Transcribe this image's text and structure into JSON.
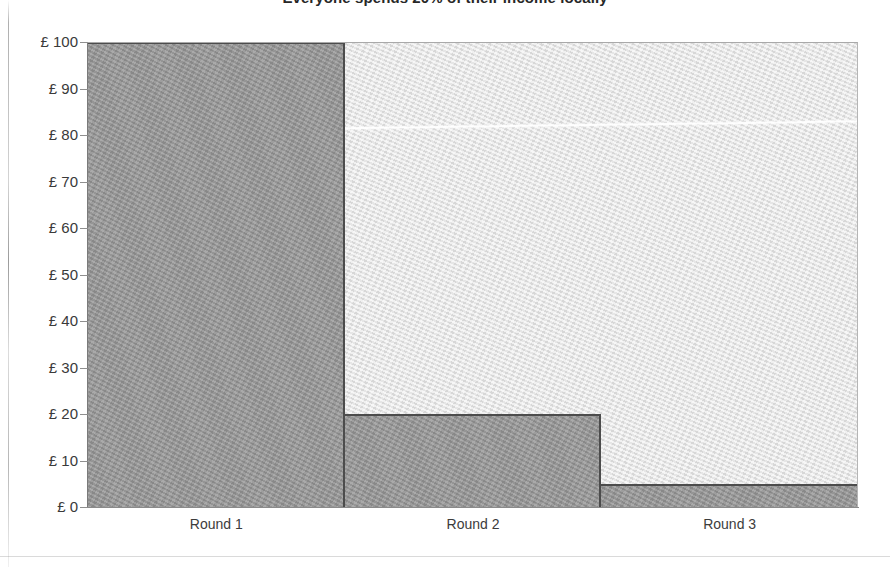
{
  "title": "Everyone spends 20% of their income locally",
  "colors": {
    "bar_fill": "#959595",
    "bar_outline": "#4c4c4c",
    "plot_background": "#e3e3e3",
    "axis": "#8a8a8a",
    "text": "#333333",
    "streak": "#ffffff"
  },
  "y_axis": {
    "labels": [
      "£ 100",
      "£ 90",
      "£ 80",
      "£ 70",
      "£ 60",
      "£ 50",
      "£ 40",
      "£ 30",
      "£ 20",
      "£ 10",
      "£ 0"
    ],
    "values": [
      100,
      90,
      80,
      70,
      60,
      50,
      40,
      30,
      20,
      10,
      0
    ]
  },
  "x_axis": {
    "labels": [
      "Round 1",
      "Round 2",
      "Round 3"
    ]
  },
  "chart_data": {
    "type": "bar",
    "title": "Everyone spends 20% of their income locally",
    "xlabel": "",
    "ylabel": "",
    "categories": [
      "Round 1",
      "Round 2",
      "Round 3"
    ],
    "values": [
      100,
      20,
      5
    ],
    "tick_labels": [
      "£ 100",
      "£ 90",
      "£ 80",
      "£ 70",
      "£ 60",
      "£ 50",
      "£ 40",
      "£ 30",
      "£ 20",
      "£ 10",
      "£ 0"
    ],
    "ylim": [
      0,
      100
    ],
    "ytick_step": 10,
    "currency": "£",
    "grid": false,
    "legend": false
  }
}
